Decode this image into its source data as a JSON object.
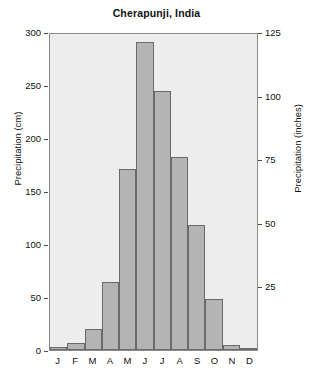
{
  "chart_data": {
    "type": "bar",
    "title": "Cherapunji, India",
    "xlabel": "",
    "ylabel": "Precipitation (cm)",
    "ylabel_secondary": "Precipitation (inches)",
    "categories": [
      "J",
      "F",
      "M",
      "A",
      "M",
      "J",
      "J",
      "A",
      "S",
      "O",
      "N",
      "D"
    ],
    "category_names": [
      "January",
      "February",
      "March",
      "April",
      "May",
      "June",
      "July",
      "August",
      "September",
      "October",
      "November",
      "December"
    ],
    "values": [
      3,
      7,
      20,
      64,
      171,
      291,
      244,
      182,
      118,
      48,
      5,
      1
    ],
    "units": "cm",
    "ylim": [
      0,
      300
    ],
    "yticks": [
      0,
      50,
      100,
      150,
      200,
      250,
      300
    ],
    "ylim_secondary": [
      0,
      125
    ],
    "yticks_secondary": [
      25,
      50,
      75,
      100,
      125
    ],
    "grid": false,
    "legend": null,
    "bar_color": "#b4b4b4",
    "bar_edge_color": "#6a6a6a",
    "plot_background": "#ededed"
  },
  "axes": {
    "left_ticks": [
      {
        "label": "300",
        "value": 300
      },
      {
        "label": "250",
        "value": 250
      },
      {
        "label": "200",
        "value": 200
      },
      {
        "label": "150",
        "value": 150
      },
      {
        "label": "100",
        "value": 100
      },
      {
        "label": "50",
        "value": 50
      },
      {
        "label": "0",
        "value": 0
      }
    ],
    "right_ticks": [
      {
        "label": "125",
        "value": 125
      },
      {
        "label": "100",
        "value": 100
      },
      {
        "label": "75",
        "value": 75
      },
      {
        "label": "50",
        "value": 50
      },
      {
        "label": "25",
        "value": 25
      }
    ]
  }
}
